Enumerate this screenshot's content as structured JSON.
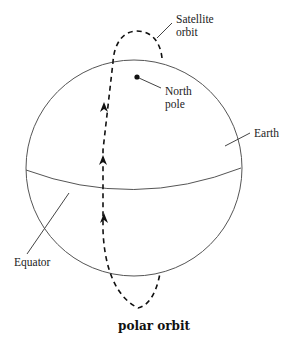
{
  "diagram": {
    "caption": "polar orbit",
    "labels": {
      "satellite_orbit_line1": "Satellite",
      "satellite_orbit_line2": "orbit",
      "north_pole_line1": "North",
      "north_pole_line2": "pole",
      "earth": "Earth",
      "equator": "Equator"
    },
    "elements": [
      {
        "name": "earth",
        "shape": "sphere"
      },
      {
        "name": "equator",
        "shape": "ellipse-arc"
      },
      {
        "name": "satellite-orbit",
        "shape": "dashed-loop",
        "direction": "northward"
      },
      {
        "name": "north-pole",
        "shape": "dot"
      }
    ],
    "colors": {
      "line": "#444444",
      "orbit": "#111111",
      "background": "#ffffff"
    }
  }
}
